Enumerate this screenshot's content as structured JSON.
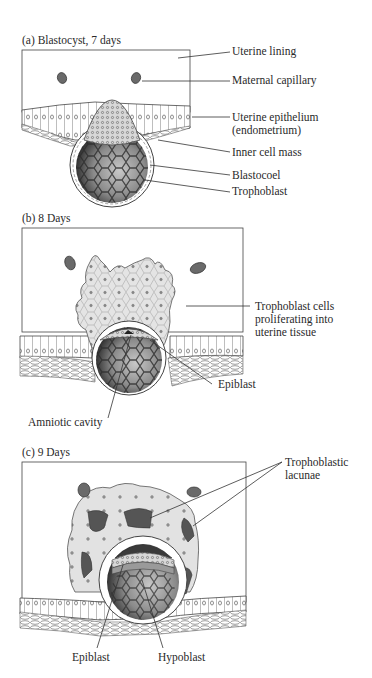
{
  "panels": [
    {
      "id": "a",
      "title": "(a)  Blastocyst, 7 days",
      "labels": {
        "uterine_lining": "Uterine lining",
        "maternal_capillary": "Maternal capillary",
        "uterine_epithelium_1": "Uterine epithelium",
        "uterine_epithelium_2": "(endometrium)",
        "inner_cell_mass": "Inner cell mass",
        "blastocoel": "Blastocoel",
        "trophoblast": "Trophoblast"
      }
    },
    {
      "id": "b",
      "title": "(b)  8 Days",
      "labels": {
        "trophoblast_cells_1": "Trophoblast cells",
        "trophoblast_cells_2": "proliferating into",
        "trophoblast_cells_3": "uterine tissue",
        "epiblast": "Epiblast",
        "amniotic_cavity": "Amniotic cavity"
      }
    },
    {
      "id": "c",
      "title": "(c)  9 Days",
      "labels": {
        "lacunae_1": "Trophoblastic",
        "lacunae_2": "lacunae",
        "epiblast": "Epiblast",
        "hypoblast": "Hypoblast"
      }
    }
  ],
  "colors": {
    "capillary": "#6a6a6a",
    "blastocoel_dark": "#3c3c3c",
    "blastocoel_light": "#bdbdbd",
    "trophoblast_fill": "#e6e6e6",
    "lacuna": "#555555",
    "line": "#333333"
  }
}
